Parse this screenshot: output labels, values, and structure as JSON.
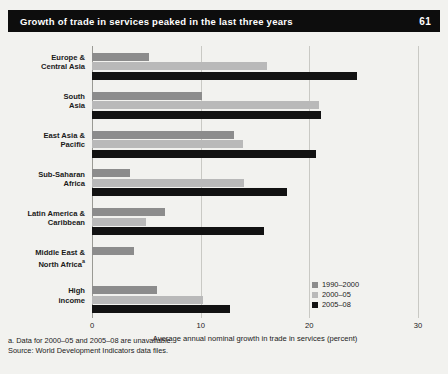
{
  "header": {
    "title": "Growth of trade in services peaked in the last three years",
    "page_number": "61"
  },
  "footnotes": {
    "note_a": "a. Data for 2000–05 and 2005–08 are unavailable.",
    "source": "Source: World Development Indicators data files."
  },
  "colors": {
    "title_bar": "#0d0d0d",
    "background": "#f2f2ef",
    "series_1990_2000": "#8c8c8c",
    "series_2000_05": "#b9b9b9",
    "series_2005_08": "#121212",
    "gridline": "#c9c9c4"
  },
  "chart_data": {
    "type": "bar",
    "orientation": "horizontal",
    "title": "Growth of trade in services peaked in the last three years",
    "xlabel": "Average annual nominal growth in trade in services (percent)",
    "ylabel": "",
    "xlim": [
      0,
      30
    ],
    "xticks": [
      0,
      10,
      20,
      30
    ],
    "xtick_labels": [
      "0",
      "10",
      "20",
      "30"
    ],
    "grid": true,
    "legend_position": "bottom-right",
    "categories": [
      "Europe & Central Asia",
      "South Asia",
      "East Asia & Pacific",
      "Sub-Saharan Africa",
      "Latin America & Caribbean",
      "Middle East & North Africa",
      "High income"
    ],
    "category_lines": [
      [
        "Europe &",
        "Central Asia"
      ],
      [
        "South",
        "Asia"
      ],
      [
        "East Asia &",
        "Pacific"
      ],
      [
        "Sub-Saharan",
        "Africa"
      ],
      [
        "Latin America &",
        "Caribbean"
      ],
      [
        "Middle East &",
        "North Africa"
      ],
      [
        "High",
        "income"
      ]
    ],
    "category_footnote_marks": [
      "",
      "",
      "",
      "",
      "",
      "a",
      ""
    ],
    "series": [
      {
        "name": "1990–2000",
        "color": "#8c8c8c",
        "values": [
          5.2,
          10.1,
          13.1,
          3.5,
          6.7,
          3.9,
          6.0
        ]
      },
      {
        "name": "2000–05",
        "color": "#b9b9b9",
        "values": [
          16.1,
          20.9,
          13.9,
          14.0,
          5.0,
          null,
          10.2
        ]
      },
      {
        "name": "2005–08",
        "color": "#121212",
        "values": [
          24.4,
          21.1,
          20.6,
          17.9,
          15.8,
          null,
          12.7
        ]
      }
    ]
  }
}
